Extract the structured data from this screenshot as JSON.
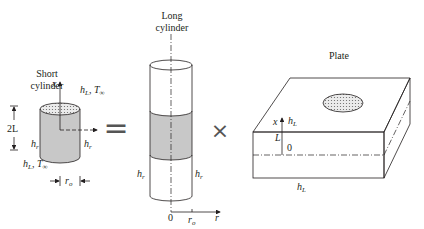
{
  "short_cylinder": {
    "title_line1": "Short",
    "title_line2": "cylinder",
    "axis_x": "x",
    "top_h": "h",
    "top_h_sub": "L",
    "top_T": ", T",
    "top_T_sub": "∞",
    "height_label": "2L",
    "left_h": "h",
    "left_h_sub": "r",
    "right_h": "h",
    "right_h_sub": "r",
    "bottom_h": "h",
    "bottom_h_sub": "L",
    "bottom_T": ", T",
    "bottom_T_sub": "∞",
    "radius_r": "r",
    "radius_sub": "o"
  },
  "operators": {
    "equals": "=",
    "times": "×"
  },
  "long_cylinder": {
    "title_line1": "Long",
    "title_line2": "cylinder",
    "left_h": "h",
    "left_h_sub": "r",
    "right_h": "h",
    "right_h_sub": "r",
    "origin": "0",
    "radius_r": "r",
    "radius_sub": "o",
    "axis_r": "r"
  },
  "plate": {
    "title": "Plate",
    "axis_x": "x",
    "top_h": "h",
    "top_h_sub": "L",
    "L_label": "L",
    "origin": "0",
    "bottom_h": "h",
    "bottom_h_sub": "L"
  },
  "colors": {
    "shade": "#c8c8c8",
    "dots": "#bfbfbf",
    "stroke": "#231f20"
  }
}
